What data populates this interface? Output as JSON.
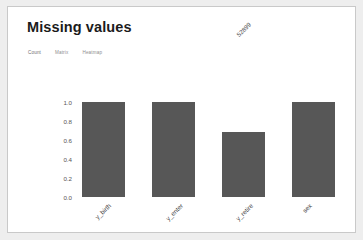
{
  "card": {
    "title": "Missing values"
  },
  "tabs": [
    {
      "label": "Count",
      "active": true
    },
    {
      "label": "Matrix",
      "active": false
    },
    {
      "label": "Heatmap",
      "active": false
    }
  ],
  "chart_data": {
    "type": "bar",
    "title": "",
    "xlabel": "",
    "ylabel": "",
    "categories": [
      "y_birth",
      "y_enter",
      "y_retire",
      "sex"
    ],
    "values": [
      1.0,
      1.0,
      0.687,
      1.0
    ],
    "counts": [
      "76982",
      "76983",
      "52899",
      "76983"
    ],
    "ytick_labels": [
      "1.0",
      "0.8",
      "0.6",
      "0.4",
      "0.2",
      "0.0"
    ],
    "ytick_values": [
      1.0,
      0.8,
      0.6,
      0.4,
      0.2,
      0.0
    ],
    "ylim": [
      0.0,
      1.0
    ],
    "grid": false,
    "legend": "none",
    "bar_color": "#575757"
  },
  "colors": {
    "page_background": "#eeeeee",
    "card_background": "#ffffff",
    "card_border": "#c9c9c9",
    "bar": "#575757",
    "title_text": "#1b1b1b",
    "tab_text": "#8e8e8e"
  }
}
